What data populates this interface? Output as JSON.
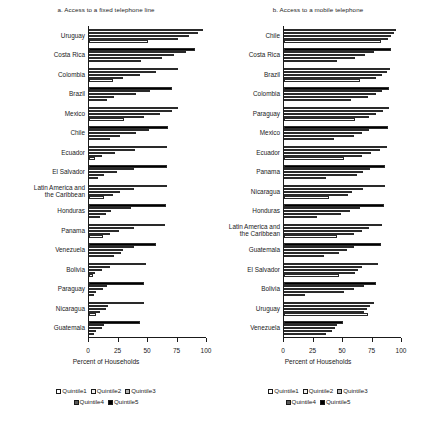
{
  "figure": {
    "xlabel": "Percent of Households",
    "legend": {
      "row1": [
        {
          "label": "Quintile1",
          "color": "#ffffff"
        },
        {
          "label": "Quintile2",
          "color": "#f2f2f2"
        },
        {
          "label": "Quintile3",
          "color": "#b5b5b5"
        }
      ],
      "row2": [
        {
          "label": "Quintile4",
          "color": "#595959"
        },
        {
          "label": "Quintile5",
          "color": "#000000"
        }
      ]
    },
    "series_names": [
      "Quintile1",
      "Quintile2",
      "Quintile3",
      "Quintile4",
      "Quintile5"
    ],
    "series_colors": [
      "#ffffff",
      "#f2f2f2",
      "#b5b5b5",
      "#595959",
      "#000000"
    ],
    "xticks": [
      0,
      25,
      50,
      75,
      100
    ],
    "xlim": [
      0,
      100
    ]
  },
  "chart_data": [
    {
      "type": "bar",
      "orientation": "horizontal",
      "title": "a. Access to a fixed telephone line",
      "xlabel": "Percent of Households",
      "ylabel": "",
      "xlim": [
        0,
        100
      ],
      "xticks": [
        0,
        25,
        50,
        75,
        100
      ],
      "grid": false,
      "legend_position": "bottom",
      "categories": [
        "Uruguay",
        "Costa Rica",
        "Colombia",
        "Brazil",
        "Mexico",
        "Chile",
        "Ecuador",
        "El Salvador",
        "Latin America and\nthe Caribbean",
        "Honduras",
        "Panama",
        "Venezuela",
        "Bolivia",
        "Paraguay",
        "Nicaragua",
        "Guatemala"
      ],
      "series": [
        {
          "name": "Quintile1",
          "values": [
            50,
            44,
            20,
            15,
            30,
            18,
            5,
            8,
            13,
            9,
            12,
            21,
            3,
            4,
            6,
            4
          ]
        },
        {
          "name": "Quintile2",
          "values": [
            75,
            62,
            29,
            21,
            47,
            26,
            11,
            13,
            20,
            14,
            18,
            27,
            5,
            6,
            9,
            6
          ]
        },
        {
          "name": "Quintile3",
          "values": [
            85,
            72,
            43,
            40,
            60,
            40,
            22,
            24,
            26,
            19,
            25,
            29,
            11,
            12,
            14,
            11
          ]
        },
        {
          "name": "Quintile4",
          "values": [
            92,
            82,
            57,
            52,
            70,
            51,
            39,
            38,
            38,
            36,
            38,
            38,
            18,
            15,
            16,
            13
          ]
        },
        {
          "name": "Quintile5",
          "values": [
            97,
            90,
            75,
            70,
            75,
            67,
            66,
            66,
            66,
            65,
            64,
            57,
            48,
            47,
            47,
            43
          ]
        }
      ]
    },
    {
      "type": "bar",
      "orientation": "horizontal",
      "title": "b. Access to a mobile telephone",
      "xlabel": "Percent of Households",
      "ylabel": "",
      "xlim": [
        0,
        100
      ],
      "xticks": [
        0,
        25,
        50,
        75,
        100
      ],
      "grid": false,
      "legend_position": "bottom",
      "categories": [
        "Chile",
        "Costa Rica",
        "Brazil",
        "Colombia",
        "Paraguay",
        "Mexico",
        "Ecuador",
        "Panama",
        "Nicaragua",
        "Honduras",
        "Latin America and\nthe Caribbean",
        "Guatemala",
        "El Salvador",
        "Bolivia",
        "Uruguay",
        "Venezuela"
      ],
      "series": [
        {
          "name": "Quintile1",
          "values": [
            82,
            45,
            64,
            57,
            60,
            42,
            51,
            36,
            38,
            28,
            45,
            34,
            47,
            18,
            71,
            36
          ]
        },
        {
          "name": "Quintile2",
          "values": [
            88,
            60,
            78,
            71,
            72,
            59,
            66,
            62,
            54,
            48,
            59,
            47,
            60,
            51,
            68,
            41
          ]
        },
        {
          "name": "Quintile3",
          "values": [
            91,
            69,
            83,
            78,
            78,
            66,
            74,
            67,
            58,
            56,
            66,
            53,
            63,
            59,
            70,
            43
          ]
        },
        {
          "name": "Quintile4",
          "values": [
            93,
            76,
            87,
            83,
            84,
            72,
            81,
            73,
            67,
            64,
            72,
            59,
            66,
            68,
            73,
            45
          ]
        },
        {
          "name": "Quintile5",
          "values": [
            95,
            91,
            90,
            89,
            89,
            88,
            87,
            86,
            86,
            85,
            83,
            82,
            80,
            78,
            76,
            50
          ]
        }
      ]
    }
  ]
}
